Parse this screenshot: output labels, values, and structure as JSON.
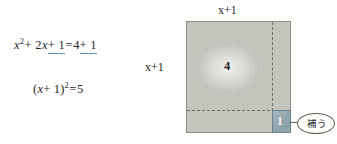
{
  "figure": {
    "title_text": "",
    "equations": [
      {
        "id": "equation-line-1",
        "parts": {
          "x": "x",
          "sq_exp": "2",
          "plus1": "+ 2",
          "x2": "x",
          "underlined_left": "+ 1",
          "equals": "=",
          "four": "4",
          "underlined_right": "+ 1"
        },
        "plain": "x² + 2x + 1 = 4 + 1"
      },
      {
        "id": "equation-line-2",
        "parts": {
          "open": "(",
          "x": "x",
          "plus_one": "+ 1",
          "close": ")",
          "exp": "2",
          "equals": "=",
          "five": "5"
        },
        "plain": "(x + 1)² = 5"
      }
    ],
    "diagram": {
      "label_top": "x+1",
      "label_left": "x+1",
      "area_main": "4",
      "area_unit": "1",
      "callout": "補う",
      "colors": {
        "square_fill": "#c4c5bd",
        "square_border": "#8d8e88",
        "unit_fill": "#8fa3ab",
        "unit_border": "#6e828b",
        "dash_line": "#6f6d62",
        "underline_accent": "#5d8fb5",
        "page_background": "#fdfdfb"
      }
    }
  }
}
